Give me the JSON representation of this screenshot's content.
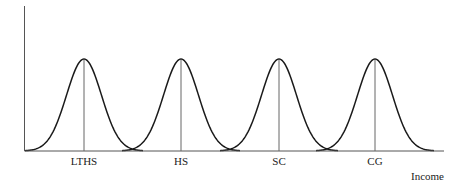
{
  "chart_data": {
    "type": "line",
    "title": "",
    "xlabel": "Income",
    "ylabel": "",
    "categories": [
      "LTHS",
      "HS",
      "SC",
      "CG"
    ],
    "series": [
      {
        "name": "LTHS",
        "mean_x_px": 84,
        "peak_y_px": 59
      },
      {
        "name": "HS",
        "mean_x_px": 181,
        "peak_y_px": 59
      },
      {
        "name": "SC",
        "mean_x_px": 279,
        "peak_y_px": 59
      },
      {
        "name": "CG",
        "mean_x_px": 375,
        "peak_y_px": 59
      }
    ],
    "grid": false,
    "legend": "none"
  },
  "labels": {
    "xlabel": "Income",
    "categories": [
      "LTHS",
      "HS",
      "SC",
      "CG"
    ]
  },
  "colors": {
    "curve": "#1a1a1a",
    "axis": "#555555",
    "mean_line": "#666666"
  }
}
